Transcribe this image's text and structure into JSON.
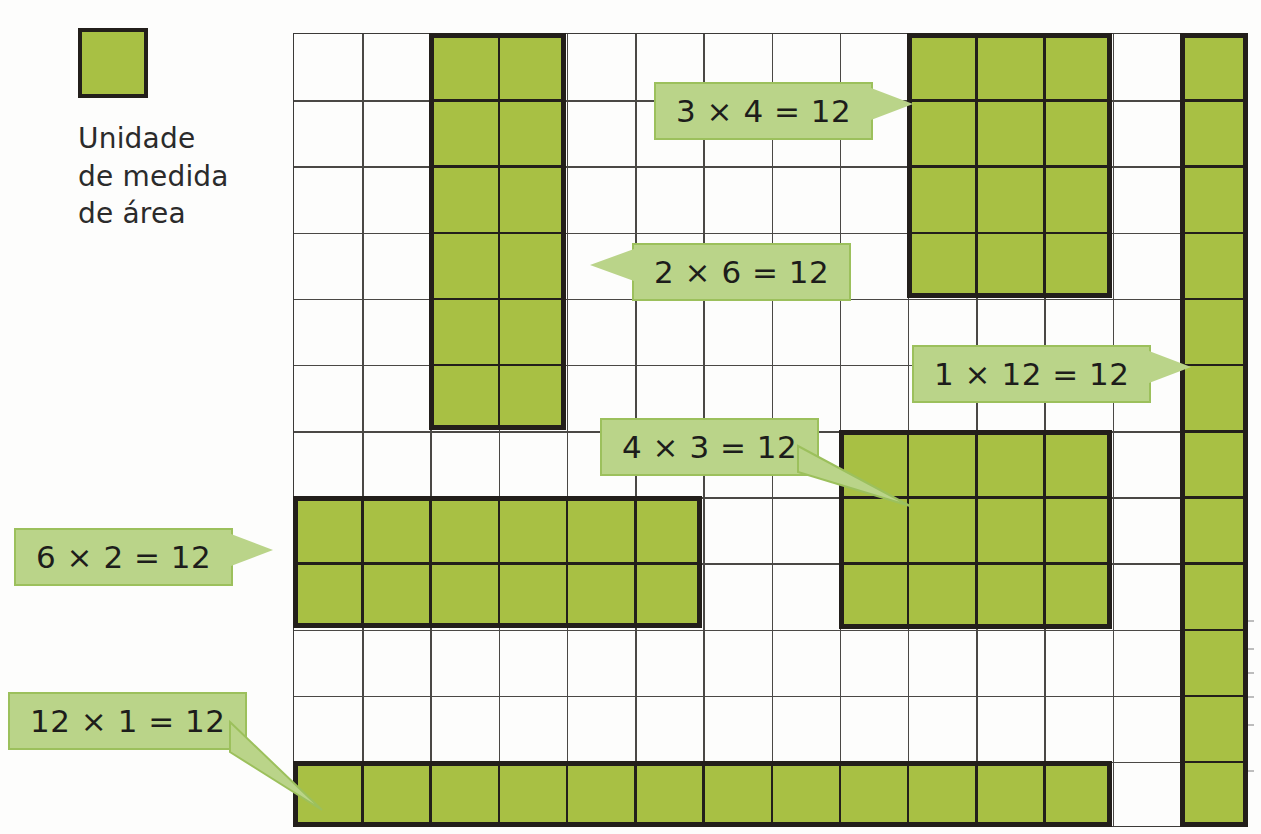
{
  "legend": {
    "swatch_color": "#a8c044",
    "swatch_border": "#231f1b",
    "caption": "Unidade\nde medida\nde área"
  },
  "grid": {
    "columns": 14,
    "rows": 12,
    "cell_px": 68,
    "line_color": "#4a4845",
    "background": "#ffffff"
  },
  "theme": {
    "cell_fill": "#a8c044",
    "rect_outline": "#231f1b",
    "callout_fill": "#bad489",
    "callout_border": "#9cc05c",
    "text_color": "#1d1d1b"
  },
  "chart_data": {
    "type": "diagram",
    "unit": "Unidade de medida de área",
    "grid_columns": 14,
    "grid_rows": 12,
    "rectangles": [
      {
        "id": "r-2x6",
        "label": "2 × 6 = 12",
        "cols": 2,
        "rows": 6,
        "col_start": 2,
        "row_start": 0,
        "area": 12
      },
      {
        "id": "r-3x4",
        "label": "3 × 4 = 12",
        "cols": 3,
        "rows": 4,
        "col_start": 9,
        "row_start": 0,
        "area": 12
      },
      {
        "id": "r-1x12",
        "label": "1 × 12 = 12",
        "cols": 1,
        "rows": 12,
        "col_start": 13,
        "row_start": 0,
        "area": 12
      },
      {
        "id": "r-4x3",
        "label": "4 × 3 = 12",
        "cols": 4,
        "rows": 3,
        "col_start": 8,
        "row_start": 6,
        "area": 12
      },
      {
        "id": "r-6x2",
        "label": "6 × 2 = 12",
        "cols": 6,
        "rows": 2,
        "col_start": 0,
        "row_start": 7,
        "area": 12
      },
      {
        "id": "r-12x1",
        "label": "12 × 1 = 12",
        "cols": 12,
        "rows": 1,
        "col_start": 0,
        "row_start": 11,
        "area": 12
      }
    ]
  },
  "callouts": {
    "c1": {
      "text": "3 × 4 = 12"
    },
    "c2": {
      "text": "2 × 6 = 12"
    },
    "c3": {
      "text": "1 × 12 = 12"
    },
    "c4": {
      "text": "4 × 3 = 12"
    },
    "c5": {
      "text": "6 × 2 = 12"
    },
    "c6": {
      "text": "12 × 1 = 12"
    }
  }
}
